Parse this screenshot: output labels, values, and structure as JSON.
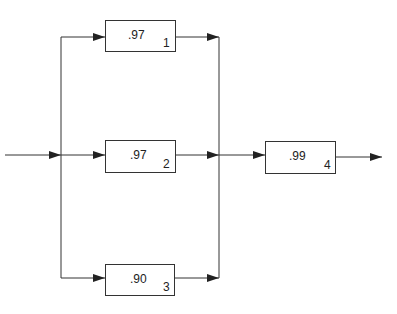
{
  "diagram": {
    "type": "reliability-block-diagram",
    "blocks": [
      {
        "id": "1",
        "value": ".97",
        "label": "1"
      },
      {
        "id": "2",
        "value": ".97",
        "label": "2"
      },
      {
        "id": "3",
        "value": ".90",
        "label": "3"
      },
      {
        "id": "4",
        "value": ".99",
        "label": "4"
      }
    ],
    "structure": "blocks 1, 2, 3 in parallel, followed by block 4 in series"
  }
}
